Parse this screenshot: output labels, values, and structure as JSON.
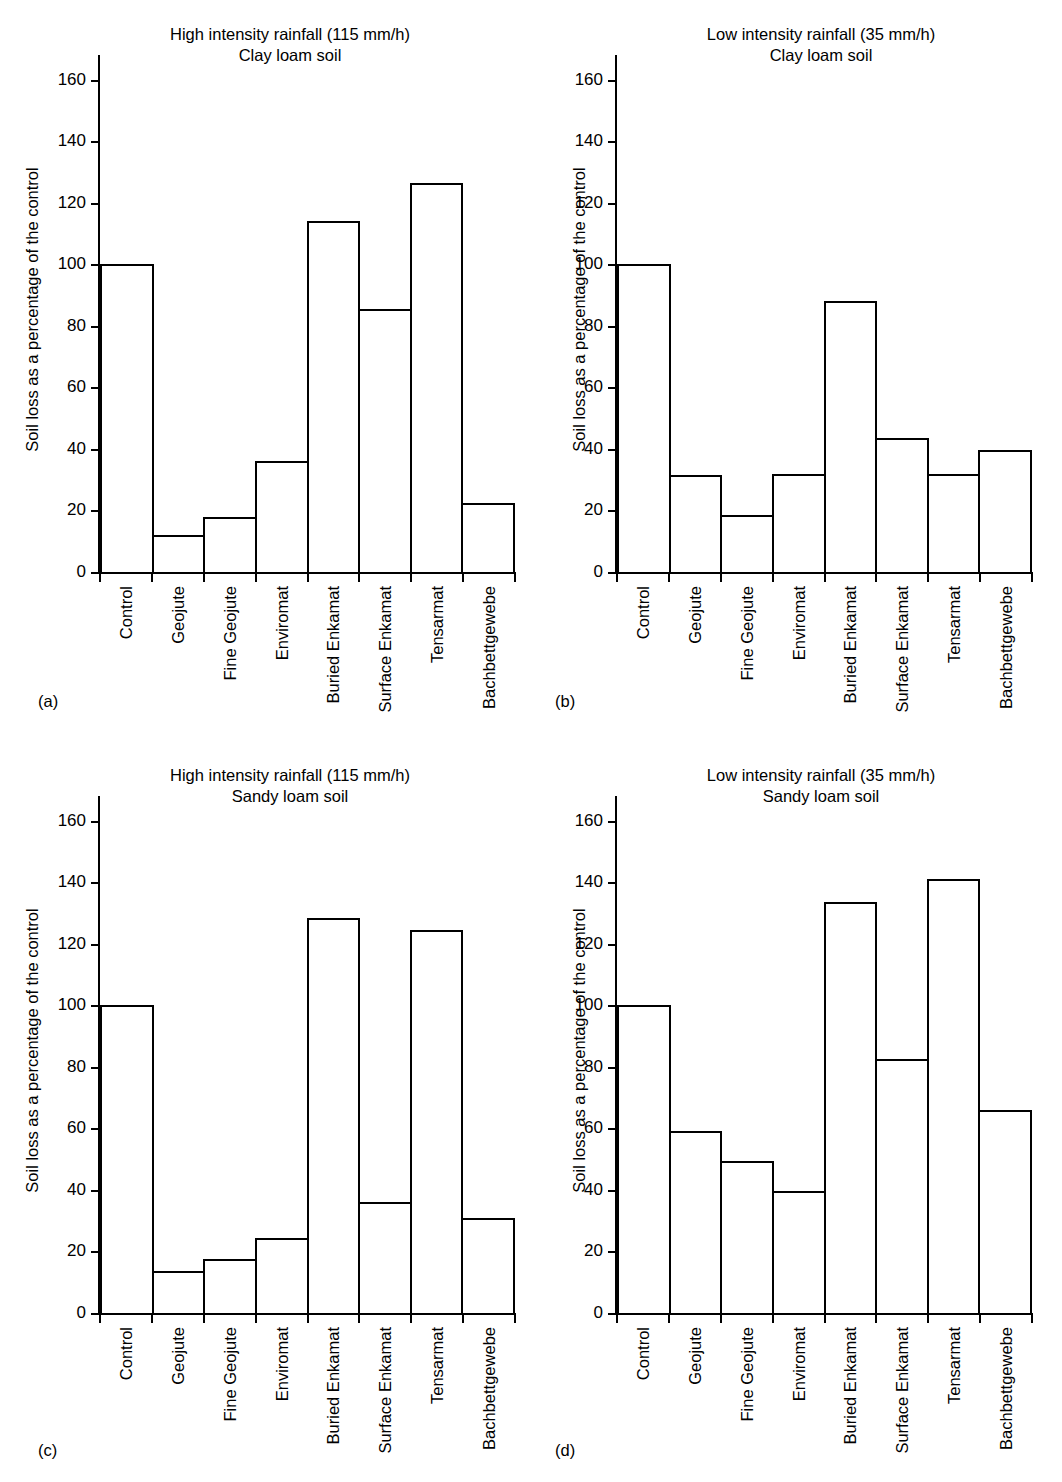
{
  "figure": {
    "axis_label": "Soil loss as a percentage of the control",
    "categories": [
      "Control",
      "Geojute",
      "Fine Geojute",
      "Enviromat",
      "Buried Enkamat",
      "Surface Enkamat",
      "Tensarmat",
      "Bachbettgewebe"
    ],
    "yticks": [
      0,
      20,
      40,
      60,
      80,
      100,
      120,
      140,
      160
    ],
    "ylim": [
      0,
      168
    ]
  },
  "panels": [
    {
      "tag": "(a)",
      "title": "High intensity rainfall (115 mm/h)\nClay loam soil",
      "ylabel": "Soil loss as a percentage of the control"
    },
    {
      "tag": "(b)",
      "title": "Low intensity rainfall (35 mm/h)\nClay loam soil",
      "ylabel": "Soil loss as a percentage of the control"
    },
    {
      "tag": "(c)",
      "title": "High intensity rainfall (115 mm/h)\nSandy loam soil",
      "ylabel": "Soil loss as a percentage of the control"
    },
    {
      "tag": "(d)",
      "title": "Low intensity rainfall (35 mm/h)\nSandy loam soil",
      "ylabel": "Soil loss as a percentage of the control"
    }
  ],
  "chart_data": [
    {
      "type": "bar",
      "panel": "(a)",
      "title": "High intensity rainfall (115 mm/h) Clay loam soil",
      "xlabel": "",
      "ylabel": "Soil loss as a percentage of the control",
      "ylim": [
        0,
        168
      ],
      "yticks": [
        0,
        20,
        40,
        60,
        80,
        100,
        120,
        140,
        160
      ],
      "grid": false,
      "legend": "none",
      "categories": [
        "Control",
        "Geojute",
        "Fine Geojute",
        "Enviromat",
        "Buried Enkamat",
        "Surface Enkamat",
        "Tensarmat",
        "Bachbettgewebe"
      ],
      "values": [
        100,
        12,
        18,
        36,
        114,
        85.5,
        126.5,
        22.5
      ]
    },
    {
      "type": "bar",
      "panel": "(b)",
      "title": "Low intensity rainfall (35 mm/h) Clay loam soil",
      "xlabel": "",
      "ylabel": "Soil loss as a percentage of the control",
      "ylim": [
        0,
        168
      ],
      "yticks": [
        0,
        20,
        40,
        60,
        80,
        100,
        120,
        140,
        160
      ],
      "grid": false,
      "legend": "none",
      "categories": [
        "Control",
        "Geojute",
        "Fine Geojute",
        "Enviromat",
        "Buried Enkamat",
        "Surface Enkamat",
        "Tensarmat",
        "Bachbettgewebe"
      ],
      "values": [
        100,
        31.5,
        18.5,
        32,
        88,
        43.5,
        32,
        39.5
      ]
    },
    {
      "type": "bar",
      "panel": "(c)",
      "title": "High intensity rainfall (115 mm/h) Sandy loam soil",
      "xlabel": "",
      "ylabel": "Soil loss as a percentage of the control",
      "ylim": [
        0,
        168
      ],
      "yticks": [
        0,
        20,
        40,
        60,
        80,
        100,
        120,
        140,
        160
      ],
      "grid": false,
      "legend": "none",
      "categories": [
        "Control",
        "Geojute",
        "Fine Geojute",
        "Enviromat",
        "Buried Enkamat",
        "Surface Enkamat",
        "Tensarmat",
        "Bachbettgewebe"
      ],
      "values": [
        100,
        13.5,
        17.5,
        24.5,
        128.5,
        36,
        124.5,
        31
      ]
    },
    {
      "type": "bar",
      "panel": "(d)",
      "title": "Low intensity rainfall (35 mm/h) Sandy loam soil",
      "xlabel": "",
      "ylabel": "Soil loss as a percentage of the control",
      "ylim": [
        0,
        168
      ],
      "yticks": [
        0,
        20,
        40,
        60,
        80,
        100,
        120,
        140,
        160
      ],
      "grid": false,
      "legend": "none",
      "categories": [
        "Control",
        "Geojute",
        "Fine Geojute",
        "Enviromat",
        "Buried Enkamat",
        "Surface Enkamat",
        "Tensarmat",
        "Bachbettgewebe"
      ],
      "values": [
        100,
        59,
        49.5,
        39.5,
        133.5,
        82.5,
        141,
        66
      ]
    }
  ]
}
